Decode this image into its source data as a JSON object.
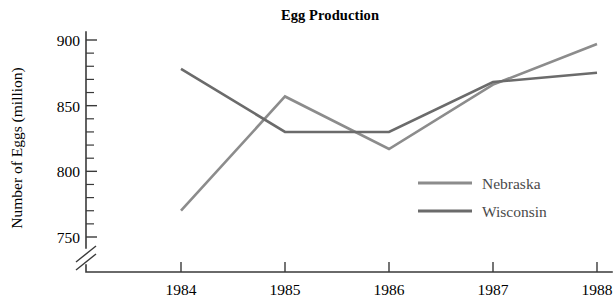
{
  "chart_data": {
    "type": "line",
    "title": "Egg Production",
    "xlabel": "",
    "ylabel": "Number of Eggs (million)",
    "x": [
      1984,
      1985,
      1986,
      1987,
      1988
    ],
    "xtick_labels": [
      "1984",
      "1985",
      "1986",
      "1987",
      "1988"
    ],
    "ytick_labels": [
      "750",
      "800",
      "850",
      "900"
    ],
    "ytick_values": [
      750,
      800,
      850,
      900
    ],
    "yminor_step": 10,
    "ylim": [
      750,
      905
    ],
    "xlim": [
      1983.6,
      1988.25
    ],
    "grid": false,
    "axis_break": true,
    "axis_break_note": "y-axis broken below 750",
    "legend_position": "inside-right",
    "series": [
      {
        "name": "Nebraska",
        "color": "#8c8c8c",
        "values": [
          770,
          857,
          817,
          866,
          897
        ]
      },
      {
        "name": "Wisconsin",
        "color": "#6b6b6b",
        "values": [
          878,
          830,
          830,
          868,
          875
        ]
      }
    ]
  },
  "legend": {
    "entries": [
      {
        "label": "Nebraska",
        "color": "#8c8c8c"
      },
      {
        "label": "Wisconsin",
        "color": "#6b6b6b"
      }
    ]
  },
  "axes": {
    "y_title": "Number of Eggs (million)",
    "y_ticks": [
      "900",
      "850",
      "800",
      "750"
    ],
    "x_ticks": [
      "1984",
      "1985",
      "1986",
      "1987",
      "1988"
    ]
  },
  "header": {
    "title": "Egg Production"
  }
}
